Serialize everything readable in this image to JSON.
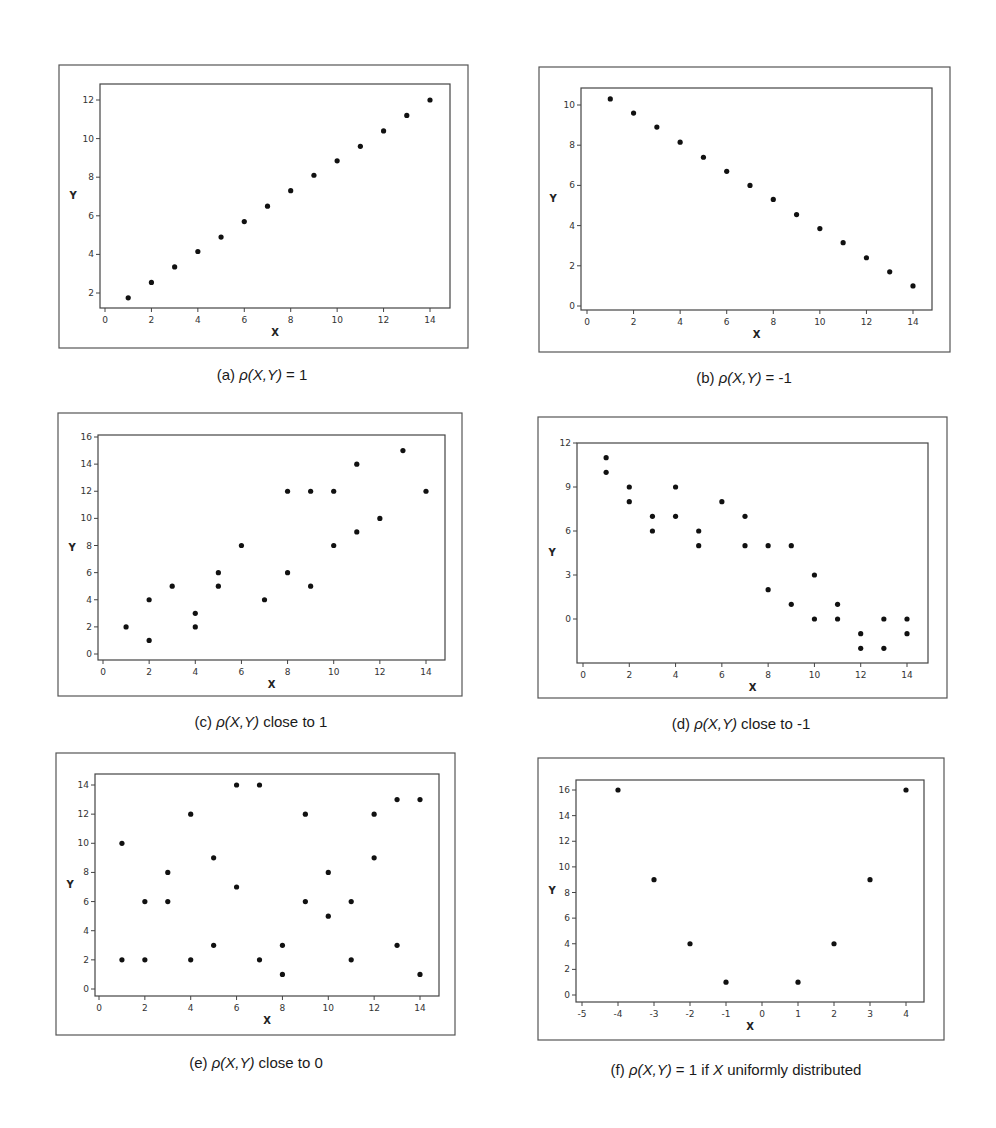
{
  "figure": {
    "marker_color": "#111111",
    "frame_color": "#555555"
  },
  "chart_data": [
    {
      "id": "a",
      "type": "scatter",
      "caption": "(a) ρ(X,Y) = 1",
      "caption_parts": {
        "label": "(a)",
        "rho": "ρ",
        "args": "(X,Y)",
        "rest": " = 1"
      },
      "xlabel": "X",
      "ylabel": "Y",
      "xlim": [
        -0.3,
        14.6
      ],
      "ylim": [
        1.2,
        12.7
      ],
      "xticks": [
        0,
        2,
        4,
        6,
        8,
        10,
        12,
        14
      ],
      "yticks": [
        2,
        4,
        6,
        8,
        10,
        12
      ],
      "grid": false,
      "points": [
        [
          1,
          1.75
        ],
        [
          2,
          2.55
        ],
        [
          3,
          3.35
        ],
        [
          4,
          4.15
        ],
        [
          5,
          4.9
        ],
        [
          6,
          5.7
        ],
        [
          7,
          6.5
        ],
        [
          8,
          7.3
        ],
        [
          9,
          8.1
        ],
        [
          10,
          8.85
        ],
        [
          11,
          9.6
        ],
        [
          12,
          10.4
        ],
        [
          13,
          11.2
        ],
        [
          14,
          12.0
        ]
      ],
      "frame": {
        "outer": [
          59,
          65,
          468,
          348
        ],
        "plot": [
          100,
          84,
          450,
          308
        ],
        "xpx": [
          105,
          430
        ],
        "ypx": [
          293,
          100
        ]
      }
    },
    {
      "id": "b",
      "type": "scatter",
      "caption": "(b) ρ(X,Y) = -1",
      "caption_parts": {
        "label": "(b)",
        "rho": "ρ",
        "args": "(X,Y)",
        "rest": " = -1"
      },
      "xlabel": "X",
      "ylabel": "Y",
      "xlim": [
        -0.3,
        14.6
      ],
      "ylim": [
        -0.1,
        10.8
      ],
      "xticks": [
        0,
        2,
        4,
        6,
        8,
        10,
        12,
        14
      ],
      "yticks": [
        0,
        2,
        4,
        6,
        8,
        10
      ],
      "grid": false,
      "points": [
        [
          1,
          10.3
        ],
        [
          2,
          9.6
        ],
        [
          3,
          8.9
        ],
        [
          4,
          8.15
        ],
        [
          5,
          7.4
        ],
        [
          6,
          6.7
        ],
        [
          7,
          6.0
        ],
        [
          8,
          5.3
        ],
        [
          9,
          4.55
        ],
        [
          10,
          3.85
        ],
        [
          11,
          3.15
        ],
        [
          12,
          2.4
        ],
        [
          13,
          1.7
        ],
        [
          14,
          1.0
        ]
      ],
      "frame": {
        "outer": [
          539,
          67,
          950,
          352
        ],
        "plot": [
          581,
          88,
          932,
          310
        ],
        "xpx": [
          587,
          913
        ],
        "ypx": [
          306,
          105
        ]
      }
    },
    {
      "id": "c",
      "type": "scatter",
      "caption": "(c) ρ(X,Y) close to 1",
      "caption_parts": {
        "label": "(c)",
        "rho": "ρ",
        "args": "(X,Y)",
        "rest": " close to 1"
      },
      "xlabel": "X",
      "ylabel": "Y",
      "xlim": [
        -0.2,
        14.8
      ],
      "ylim": [
        -0.3,
        16.3
      ],
      "xticks": [
        0,
        2,
        4,
        6,
        8,
        10,
        12,
        14
      ],
      "yticks": [
        0,
        2,
        4,
        6,
        8,
        10,
        12,
        14,
        16
      ],
      "grid": false,
      "points": [
        [
          1,
          2
        ],
        [
          2,
          4
        ],
        [
          2,
          1
        ],
        [
          3,
          5
        ],
        [
          4,
          3
        ],
        [
          4,
          2
        ],
        [
          5,
          6
        ],
        [
          5,
          5
        ],
        [
          6,
          8
        ],
        [
          7,
          4
        ],
        [
          8,
          12
        ],
        [
          8,
          6
        ],
        [
          9,
          12
        ],
        [
          9,
          5
        ],
        [
          10,
          12
        ],
        [
          10,
          8
        ],
        [
          11,
          14
        ],
        [
          11,
          9
        ],
        [
          12,
          10
        ],
        [
          13,
          15
        ],
        [
          14,
          12
        ]
      ],
      "frame": {
        "outer": [
          58,
          413,
          462,
          696
        ],
        "plot": [
          98,
          435,
          445,
          660
        ],
        "xpx": [
          103,
          426
        ],
        "ypx": [
          654,
          437
        ]
      }
    },
    {
      "id": "d",
      "type": "scatter",
      "caption": "(d) ρ(X,Y) close to -1",
      "caption_parts": {
        "label": "(d)",
        "rho": "ρ",
        "args": "(X,Y)",
        "rest": " close to -1"
      },
      "xlabel": "X",
      "ylabel": "Y",
      "xlim": [
        -0.2,
        14.8
      ],
      "ylim": [
        -3.0,
        12.0
      ],
      "xticks": [
        0,
        2,
        4,
        6,
        8,
        10,
        12,
        14
      ],
      "yticks": [
        0,
        3,
        6,
        9,
        12
      ],
      "grid": false,
      "points": [
        [
          1,
          11
        ],
        [
          1,
          10
        ],
        [
          2,
          9
        ],
        [
          2,
          8
        ],
        [
          3,
          7
        ],
        [
          3,
          6
        ],
        [
          4,
          9
        ],
        [
          4,
          7
        ],
        [
          5,
          6
        ],
        [
          5,
          5
        ],
        [
          6,
          8
        ],
        [
          7,
          7
        ],
        [
          7,
          5
        ],
        [
          8,
          5
        ],
        [
          8,
          2
        ],
        [
          9,
          5
        ],
        [
          9,
          1
        ],
        [
          10,
          3
        ],
        [
          10,
          0
        ],
        [
          11,
          1
        ],
        [
          11,
          0
        ],
        [
          12,
          -1
        ],
        [
          12,
          -2
        ],
        [
          13,
          0
        ],
        [
          13,
          -2
        ],
        [
          14,
          0
        ],
        [
          14,
          -1
        ]
      ],
      "frame": {
        "outer": [
          538,
          417,
          947,
          698
        ],
        "plot": [
          577,
          443,
          928,
          663
        ],
        "xpx": [
          583,
          907
        ],
        "ypx": [
          619,
          443
        ]
      }
    },
    {
      "id": "e",
      "type": "scatter",
      "caption": "(e) ρ(X,Y) close to 0",
      "caption_parts": {
        "label": "(e)",
        "rho": "ρ",
        "args": "(X,Y)",
        "rest": " close to 0"
      },
      "xlabel": "X",
      "ylabel": "Y",
      "xlim": [
        -0.2,
        14.8
      ],
      "ylim": [
        -0.3,
        14.7
      ],
      "xticks": [
        0,
        2,
        4,
        6,
        8,
        10,
        12,
        14
      ],
      "yticks": [
        0,
        2,
        4,
        6,
        8,
        10,
        12,
        14
      ],
      "grid": false,
      "points": [
        [
          1,
          10
        ],
        [
          1,
          2
        ],
        [
          2,
          6
        ],
        [
          2,
          2
        ],
        [
          3,
          8
        ],
        [
          3,
          6
        ],
        [
          4,
          12
        ],
        [
          4,
          2
        ],
        [
          5,
          9
        ],
        [
          5,
          3
        ],
        [
          6,
          14
        ],
        [
          6,
          7
        ],
        [
          7,
          14
        ],
        [
          7,
          2
        ],
        [
          8,
          3
        ],
        [
          8,
          1
        ],
        [
          9,
          12
        ],
        [
          9,
          6
        ],
        [
          10,
          8
        ],
        [
          10,
          5
        ],
        [
          11,
          6
        ],
        [
          11,
          2
        ],
        [
          12,
          12
        ],
        [
          12,
          9
        ],
        [
          13,
          13
        ],
        [
          13,
          3
        ],
        [
          14,
          13
        ],
        [
          14,
          1
        ]
      ],
      "frame": {
        "outer": [
          56,
          753,
          455,
          1035
        ],
        "plot": [
          95,
          774,
          439,
          996
        ],
        "xpx": [
          99,
          420
        ],
        "ypx": [
          989,
          785
        ]
      }
    },
    {
      "id": "f",
      "type": "scatter",
      "caption": "(f) ρ(X,Y) = 1 if X uniformly distributed",
      "caption_parts": {
        "label": "(f)",
        "rho": "ρ",
        "args": "(X,Y)",
        "rest": " = 1 if ",
        "var": "X",
        "tail": " uniformly distributed"
      },
      "xlabel": "X",
      "ylabel": "Y",
      "xlim": [
        -5.2,
        4.5
      ],
      "ylim": [
        -0.3,
        16.8
      ],
      "xticks": [
        -5,
        -4,
        -3,
        -2,
        -1,
        0,
        1,
        2,
        3,
        4
      ],
      "yticks": [
        0,
        2,
        4,
        6,
        8,
        10,
        12,
        14,
        16
      ],
      "grid": false,
      "points": [
        [
          -4,
          16
        ],
        [
          -3,
          9
        ],
        [
          -2,
          4
        ],
        [
          -1,
          1
        ],
        [
          1,
          1
        ],
        [
          2,
          4
        ],
        [
          3,
          9
        ],
        [
          4,
          16
        ]
      ],
      "frame": {
        "outer": [
          538,
          758,
          944,
          1040
        ],
        "plot": [
          576,
          780,
          924,
          1002
        ],
        "xpx": [
          582,
          906
        ],
        "ypx": [
          995,
          790
        ]
      }
    }
  ]
}
